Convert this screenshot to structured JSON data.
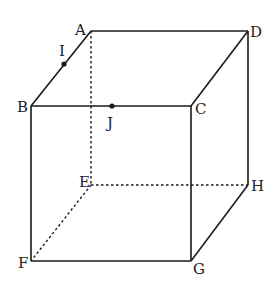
{
  "diagram": {
    "vertices": {
      "A": {
        "label": "A",
        "x": 91,
        "y": 31
      },
      "B": {
        "label": "B",
        "x": 31,
        "y": 106
      },
      "C": {
        "label": "C",
        "x": 191,
        "y": 106
      },
      "D": {
        "label": "D",
        "x": 248,
        "y": 31
      },
      "E": {
        "label": "E",
        "x": 91,
        "y": 185
      },
      "F": {
        "label": "F",
        "x": 31,
        "y": 261
      },
      "G": {
        "label": "G",
        "x": 191,
        "y": 261
      },
      "H": {
        "label": "H",
        "x": 248,
        "y": 185
      }
    },
    "points": {
      "I": {
        "label": "I",
        "on_edge": "AB",
        "x": 64,
        "y": 64
      },
      "J": {
        "label": "J",
        "on_edge": "BC",
        "x": 112,
        "y": 106
      }
    },
    "visible_edges": [
      "AD",
      "AB",
      "BC",
      "CD",
      "DH",
      "BF",
      "CG",
      "FG",
      "GH"
    ],
    "hidden_edges": [
      "AE",
      "EF",
      "EH"
    ],
    "colors": {
      "line": "#1a1a1a",
      "background": "#ffffff"
    }
  }
}
